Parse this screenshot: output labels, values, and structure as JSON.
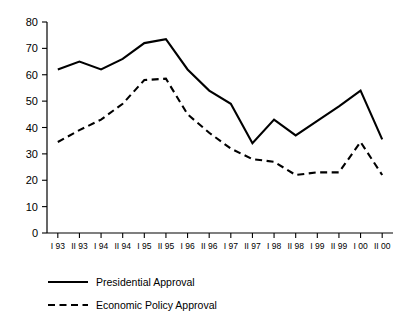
{
  "chart_data": {
    "type": "line",
    "title": "",
    "xlabel": "",
    "ylabel": "",
    "ylim": [
      0,
      80
    ],
    "ytick_step": 10,
    "grid": false,
    "legend_position": "bottom-left",
    "yticks": [
      "0",
      "10",
      "20",
      "30",
      "40",
      "50",
      "60",
      "70",
      "80"
    ],
    "categories": [
      "I 93",
      "II 93",
      "I 94",
      "II 94",
      "I 95",
      "II 95",
      "I 96",
      "II 96",
      "I 97",
      "II 97",
      "I 98",
      "II 98",
      "I 99",
      "II 99",
      "I 00",
      "II 00"
    ],
    "series": [
      {
        "name": "Presidential Approval",
        "style": "solid",
        "color": "#000000",
        "values": [
          62,
          65,
          62,
          66,
          72,
          73.5,
          62,
          54,
          49,
          34,
          43,
          37,
          42.5,
          48,
          54,
          35.5
        ]
      },
      {
        "name": "Economic Policy Approval",
        "style": "dashed",
        "color": "#000000",
        "values": [
          34.5,
          39,
          43,
          49,
          58,
          58.5,
          45,
          38,
          32,
          28,
          27,
          22,
          23,
          23,
          34.5,
          22
        ]
      }
    ]
  },
  "legend": {
    "items": [
      {
        "label": "Presidential Approval",
        "style": "solid"
      },
      {
        "label": "Economic Policy Approval",
        "style": "dashed"
      }
    ]
  }
}
